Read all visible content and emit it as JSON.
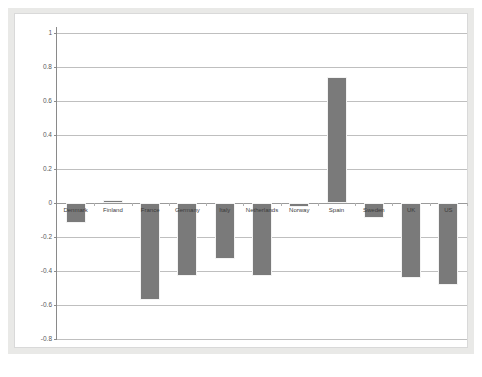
{
  "chart_data": {
    "type": "bar",
    "title": "",
    "subtitle": "",
    "xlabel": "",
    "ylabel": "",
    "ylim": [
      -0.8,
      1
    ],
    "ytick_values": [
      1,
      0.8,
      0.6,
      0.4,
      0.2,
      0,
      -0.2,
      -0.4,
      -0.6,
      -0.8
    ],
    "ytick_labels": [
      "1",
      "0.8",
      "0.6",
      "0.4",
      "0.2",
      "0",
      "-0.2",
      "-0.4",
      "-0.6",
      "-0.8"
    ],
    "grid": true,
    "legend": "none",
    "bar_color": "#7a7a7a",
    "gridline_color": "#bfbfbf",
    "axis_color": "#8a8a8a",
    "categories": [
      "Denmark",
      "Finland",
      "France",
      "Germany",
      "Italy",
      "Netherlands",
      "Norway",
      "Spain",
      "Sweden",
      "UK",
      "US"
    ],
    "values": [
      -0.12,
      0.015,
      -0.57,
      -0.43,
      -0.33,
      -0.43,
      -0.025,
      0.74,
      -0.09,
      -0.44,
      -0.48
    ]
  }
}
